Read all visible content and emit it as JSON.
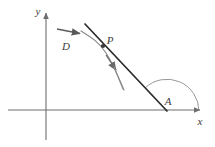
{
  "figure": {
    "type": "geometry-diagram",
    "background_color": "#ffffff",
    "axis_color": "#6e6e6e",
    "line_color": "#2b2b2b",
    "curve_color": "#8c8c8c",
    "arrow_color": "#5a5a5a",
    "arc_color": "#8c8c8c",
    "label_color": "#3c3c3c"
  },
  "axes": {
    "origin": {
      "x": 46,
      "y": 110
    },
    "x_axis": {
      "label": "x",
      "label_pos": {
        "x": 200,
        "y": 124
      },
      "start": {
        "x": 8,
        "y": 110
      },
      "end": {
        "x": 205,
        "y": 110
      }
    },
    "y_axis": {
      "label": "y",
      "label_pos": {
        "x": 38,
        "y": 15
      },
      "start": {
        "x": 46,
        "y": 140
      },
      "end": {
        "x": 46,
        "y": 8
      }
    }
  },
  "tangent_line": {
    "name": "tangent-line",
    "start": {
      "x": 85,
      "y": 24
    },
    "end": {
      "x": 167,
      "y": 111
    }
  },
  "curve": {
    "name": "curve",
    "path": "M 81,31 C 92,38 99,42 106,53 C 113,64 118,76 124,90"
  },
  "point": {
    "label": "P",
    "label_pos": {
      "x": 108,
      "y": 44
    },
    "marker": {
      "x": 103,
      "y": 46,
      "r": 2.1
    }
  },
  "direction_arrow": {
    "label": "D",
    "label_pos": {
      "x": 66,
      "y": 50
    },
    "start": {
      "x": 57,
      "y": 29
    },
    "end": {
      "x": 83,
      "y": 34
    }
  },
  "tangent_arrow": {
    "name": "tangent-direction-arrow",
    "start": {
      "x": 106,
      "y": 55
    },
    "end": {
      "x": 123,
      "y": 89
    },
    "head_at": {
      "x": 118,
      "y": 73
    }
  },
  "angle": {
    "label": "A",
    "label_pos": {
      "x": 167,
      "y": 105
    },
    "vertex": {
      "x": 167,
      "y": 111
    },
    "radius": 32,
    "arc_path": "M 199,111 A 32,32 0 0 0 145,88"
  }
}
